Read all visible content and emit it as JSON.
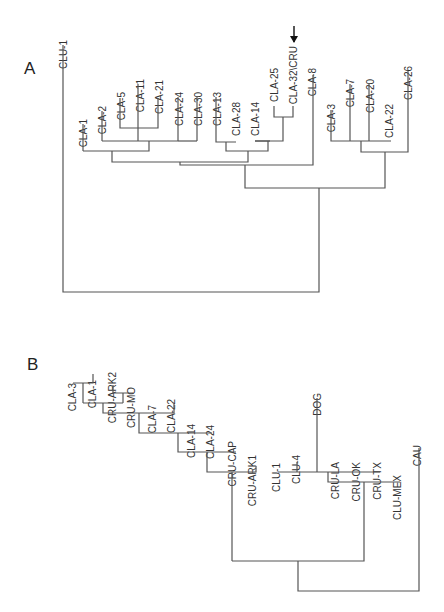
{
  "figure": {
    "panels": [
      {
        "id": "A",
        "label": "A",
        "taxa": [
          "CLU-1",
          "CLA-1",
          "CLA-2",
          "CLA-5",
          "CLA-11",
          "CLA-21",
          "CLA-24",
          "CLA-30",
          "CLA-13",
          "CLA-28",
          "CLA-14",
          "CLA-25",
          "CLA-32\\CRU",
          "CLA-8",
          "CLA-3",
          "CLA-7",
          "CLA-20",
          "CLA-22",
          "CLA-26"
        ],
        "marker": {
          "type": "arrow-down",
          "target": "CLA-32\\CRU"
        }
      },
      {
        "id": "B",
        "label": "B",
        "taxa": [
          "CLA-3",
          "CLA-1",
          "CRU-ARK2",
          "CRU-MO",
          "CLA-7",
          "CLA-22",
          "CLA-14",
          "CLA-24",
          "CRU-CAP",
          "CRU-ARK1",
          "CLU-1",
          "CLU-4",
          "DOG",
          "CRU-LA",
          "CRU-OK",
          "CRU-TX",
          "CLU-MEX",
          "CAU"
        ]
      }
    ],
    "line_color": "#555555",
    "text_color": "#333333"
  }
}
